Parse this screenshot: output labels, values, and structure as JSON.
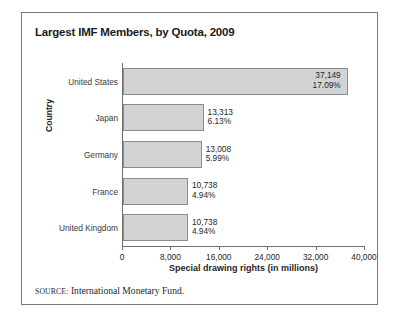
{
  "figure": {
    "title": "Largest IMF Members, by Quota, 2009",
    "source_label": "SOURCE:",
    "source_text": "International Monetary Fund.",
    "border_color": "#7a7a7a",
    "background": "#ffffff"
  },
  "chart_data": {
    "type": "bar",
    "orientation": "horizontal",
    "title": "Largest IMF Members, by Quota, 2009",
    "xlabel": "Special drawing rights (in millions)",
    "ylabel": "Country",
    "xlim": [
      0,
      40000
    ],
    "xticks": [
      0,
      8000,
      16000,
      24000,
      32000,
      40000
    ],
    "xtick_labels": [
      "0",
      "8,000",
      "16,000",
      "24,000",
      "32,000",
      "40,000"
    ],
    "grid": false,
    "legend": null,
    "bar_color": "#d3d3d3",
    "bar_edge_color": "#8c8c8c",
    "categories": [
      "United States",
      "Japan",
      "Germany",
      "France",
      "United Kingdom"
    ],
    "values": [
      37149,
      13313,
      13008,
      10738,
      10738
    ],
    "value_labels": [
      "37,149",
      "13,313",
      "13,008",
      "10,738",
      "10,738"
    ],
    "share_labels": [
      "17.09%",
      "6.13%",
      "5.99%",
      "4.94%",
      "4.94%"
    ],
    "shares": [
      17.09,
      6.13,
      5.99,
      4.94,
      4.94
    ],
    "label_placement": [
      "inside",
      "outside",
      "outside",
      "outside",
      "outside"
    ]
  }
}
